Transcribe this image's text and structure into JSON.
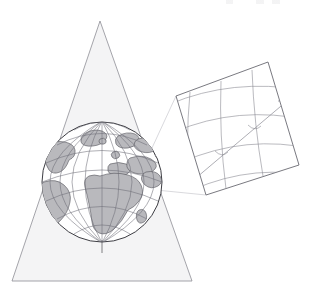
{
  "figure": {
    "background_color": "#ffffff"
  },
  "colors": {
    "cone_fill": "#f4f4f5",
    "cone_edge": "#8e8e96",
    "land_fill": "#b9b9bd",
    "land_stroke": "#4a4a50",
    "graticule": "#6d6d76",
    "globe_outline": "#3c3c42",
    "panel_border": "#6a6a72",
    "panel_grid": "#8b8b93",
    "route_line": "#8b8b93",
    "connector": "#c9c9cf"
  },
  "cone": {
    "label": "projection-cone",
    "apex": {
      "x": 100,
      "y": 21
    },
    "base_left": {
      "x": 12,
      "y": 281
    },
    "base_right": {
      "x": 192,
      "y": 281
    },
    "fill": "#f4f4f5"
  },
  "globe": {
    "label": "globe",
    "center": {
      "x": 102,
      "y": 182
    },
    "radius": 60,
    "tilt_degrees": 18,
    "parallel_count": 7,
    "meridian_count": 9,
    "visible_regions": [
      "Africa",
      "Europe",
      "South America",
      "North Atlantic Ocean",
      "Greenland",
      "Arabian Peninsula"
    ],
    "pole_axis_visible": true
  },
  "map_panel": {
    "label": "developed-conic-map",
    "corners": {
      "top_left": {
        "x": 176,
        "y": 96
      },
      "top_right": {
        "x": 268,
        "y": 62
      },
      "bottom_right": {
        "x": 299,
        "y": 165
      },
      "bottom_left": {
        "x": 206,
        "y": 195
      }
    },
    "rotation_degrees": -20,
    "graticule": {
      "meridian_count": 4,
      "parallel_count": 4,
      "curved": true
    },
    "route": {
      "label": "great-circle-track",
      "angle_marks": 3,
      "arrow_head": true
    }
  },
  "connectors": {
    "label": "projection-rays",
    "count": 2
  }
}
